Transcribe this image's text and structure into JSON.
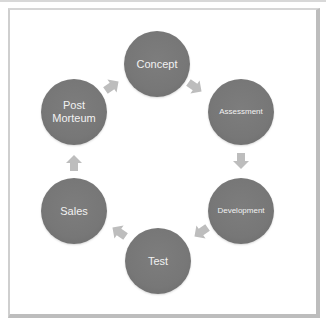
{
  "diagram": {
    "type": "cycle",
    "nodes": [
      {
        "id": "concept",
        "label": "Concept",
        "font_size": 11
      },
      {
        "id": "assessment",
        "label": "Assessment",
        "font_size": 8
      },
      {
        "id": "development",
        "label": "Development",
        "font_size": 8
      },
      {
        "id": "test",
        "label": "Test",
        "font_size": 11
      },
      {
        "id": "sales",
        "label": "Sales",
        "font_size": 11
      },
      {
        "id": "post_morteum",
        "label": "Post Morteum",
        "label_lines": [
          "Post",
          "Morteum"
        ],
        "font_size": 11
      }
    ],
    "edges": [
      {
        "from": "Concept",
        "to": "Assessment"
      },
      {
        "from": "Assessment",
        "to": "Development"
      },
      {
        "from": "Development",
        "to": "Test"
      },
      {
        "from": "Test",
        "to": "Sales"
      },
      {
        "from": "Sales",
        "to": "Post Morteum"
      },
      {
        "from": "Post Morteum",
        "to": "Concept"
      }
    ],
    "colors": {
      "node_fill": "#777777",
      "node_text": "#f2f2f2",
      "arrow_fill": "#bdbdbd",
      "frame_border": "#bdbdbd",
      "background": "#ffffff"
    }
  }
}
